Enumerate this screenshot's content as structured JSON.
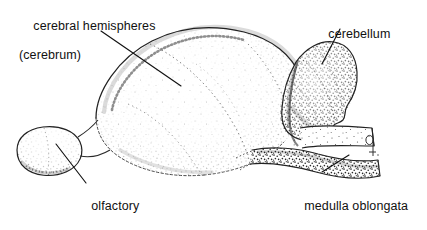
{
  "figure": {
    "subject": "brain",
    "view": "lateral",
    "style": "stippled pen-and-ink line drawing",
    "background_color": "#ffffff",
    "ink_color": "#1a1a1a",
    "width": 427,
    "height": 229
  },
  "labels": {
    "cerebrum": {
      "line1": "cerebral hemispheres",
      "line2": "(cerebrum)"
    },
    "cerebellum": {
      "line1": "cerebellum"
    },
    "olfactory": {
      "line1": "olfactory",
      "line2": "bulb"
    },
    "medulla": {
      "line1": "medulla oblongata",
      "line2": "(brain stem)"
    }
  },
  "leader_lines": [
    {
      "name": "cerebrum-leader",
      "x1": 101,
      "y1": 31,
      "x2": 181,
      "y2": 86
    },
    {
      "name": "cerebellum-leader",
      "x1": 340,
      "y1": 29,
      "x2": 322,
      "y2": 64
    },
    {
      "name": "olfactory-leader",
      "x1": 56,
      "y1": 144,
      "x2": 86,
      "y2": 183
    },
    {
      "name": "medulla-leader",
      "x1": 349,
      "y1": 155,
      "x2": 322,
      "y2": 172
    }
  ],
  "artist_mark": {
    "name": "artist-monogram",
    "x": 368,
    "y": 138
  },
  "parts": [
    {
      "name": "cerebrum",
      "description": "large domed mass occupying the left and center of the brain"
    },
    {
      "name": "cerebellum",
      "description": "lobed convoluted mass at the upper right"
    },
    {
      "name": "olfactory-bulb",
      "description": "small rounded oval lobe at the far left, lower"
    },
    {
      "name": "medulla-oblongata",
      "description": "tapering shelf-like stem extending to the lower right"
    }
  ]
}
